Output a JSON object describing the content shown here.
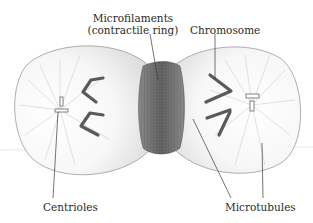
{
  "labels": {
    "microfilaments_line1": "Microfilaments",
    "microfilaments_line2": "(contractile ring)",
    "chromosome": "Chromosome",
    "centrioles": "Centrioles",
    "microtubules": "Microtubules"
  },
  "colors": {
    "outline": "#9a9a9a",
    "stipple": "#b8b8b8",
    "ring": "#6e6e6e",
    "chromosome": "#5a5a5a",
    "leader": "#3a3a3a",
    "text": "#2a2a2a"
  }
}
